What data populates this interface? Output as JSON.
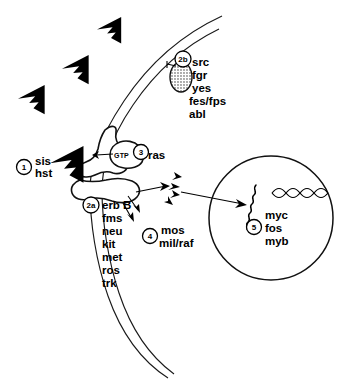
{
  "figure": {
    "background_color": "#ffffff",
    "ink_color": "#000000"
  },
  "steps": [
    {
      "id": "step-1",
      "number": "1",
      "role": "growth-factor-ligands",
      "genes": [
        "sis",
        "hst"
      ],
      "gene_text": "sis\nhst"
    },
    {
      "id": "step-2a",
      "number": "2a",
      "role": "receptor-tyrosine-kinases",
      "genes": [
        "erb B",
        "fms",
        "neu",
        "kit",
        "met",
        "ros",
        "trk"
      ]
    },
    {
      "id": "step-2b",
      "number": "2b",
      "role": "membrane-associated-tyrosine-kinases",
      "genes": [
        "src",
        "fgr",
        "yes",
        "fes/fps",
        "abl"
      ]
    },
    {
      "id": "step-3",
      "number": "3",
      "role": "gtp-binding-protein",
      "genes": [
        "ras"
      ],
      "cofactor": "GTP"
    },
    {
      "id": "step-4",
      "number": "4",
      "role": "cytoplasmic-serine-threonine-kinases",
      "genes": [
        "mos",
        "mil/raf"
      ]
    },
    {
      "id": "step-5",
      "number": "5",
      "role": "nuclear-transcription-factors",
      "genes": [
        "myc",
        "fos",
        "myb"
      ]
    }
  ],
  "labels": {
    "n1": "1",
    "n2a": "2a",
    "n2b": "2b",
    "n3": "3",
    "n4": "4",
    "n5": "5",
    "sis": "sis",
    "hst": "hst",
    "gtp": "GTP",
    "ras": "ras",
    "src": "src",
    "fgr": "fgr",
    "yes": "yes",
    "fesfps": "fes/fps",
    "abl": "abl",
    "erbB": "erb B",
    "fms": "fms",
    "neu": "neu",
    "kit": "kit",
    "met": "met",
    "ros": "ros",
    "trk": "trk",
    "mos": "mos",
    "milraf": "mil/raf",
    "myc": "myc",
    "fos": "fos",
    "myb": "myb"
  },
  "structures": {
    "plasma_membrane": "double-curved-line",
    "nucleus": "circle",
    "dna": "double-helix",
    "nascent_transcript": "squiggle",
    "receptor": "membrane-spanning-blob",
    "ligand": "sawtooth-wedge"
  }
}
